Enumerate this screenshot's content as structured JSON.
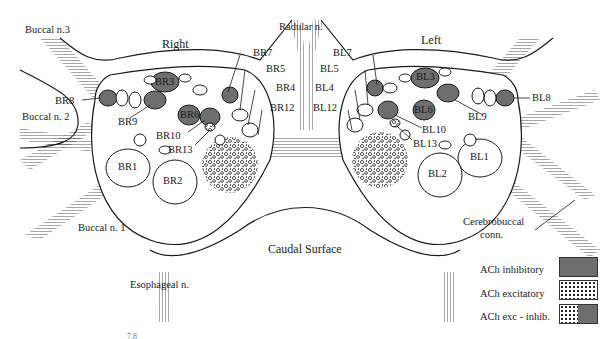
{
  "diagram": {
    "sides": {
      "right": "Right",
      "left": "Left"
    },
    "nerves": {
      "buccal_3": "Buccal n.3",
      "buccal_2": "Buccal n. 2",
      "buccal_1": "Buccal n. 1",
      "radular": "Radular n.",
      "esophageal": "Esophageal n.",
      "cerebrobuccal_1": "Cerebrobuccal",
      "cerebrobuccal_2": "conn."
    },
    "surface": "Caudal Surface",
    "neurons_right": {
      "br1": "BR1",
      "br2": "BR2",
      "br3": "BR3",
      "br4": "BR4",
      "br5": "BR5",
      "br6": "BR6",
      "br7": "BR7",
      "br8": "BR8",
      "br9": "BR9",
      "br10": "BR10",
      "br12": "BR12",
      "br13": "BR13"
    },
    "neurons_left": {
      "bl1": "BL1",
      "bl2": "BL2",
      "bl3": "BL3",
      "bl4": "BL4",
      "bl5": "BL5",
      "bl6": "BL6",
      "bl7": "BL7",
      "bl8": "BL8",
      "bl9": "BL9",
      "bl10": "BL10",
      "bl12": "BL12",
      "bl13": "BL13"
    },
    "figure_number": "7.8"
  },
  "legend": {
    "items": [
      {
        "label": "ACh inhibitory",
        "type": "inhibitory",
        "color": "#6e6e6e"
      },
      {
        "label": "ACh excitatory",
        "type": "excitatory",
        "color": "#ffffff"
      },
      {
        "label": "ACh exc - inhib.",
        "type": "mixed",
        "color": "#6e6e6e"
      }
    ]
  },
  "colors": {
    "inhibitory": "#6e6e6e",
    "outline": "#1a1a1a",
    "background": "#ffffff"
  }
}
